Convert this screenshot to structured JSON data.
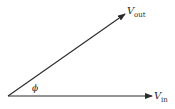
{
  "diagram": {
    "type": "phasor",
    "colors": {
      "stroke": "#2a2a2a",
      "background": "#ffffff"
    },
    "origin": [
      8,
      96
    ],
    "vectors": [
      {
        "name": "V_in",
        "symbol": "V",
        "subscript": "in",
        "tip": [
          152,
          96
        ]
      },
      {
        "name": "V_out",
        "symbol": "V",
        "subscript": "out",
        "tip": [
          125,
          14
        ]
      }
    ],
    "angle": {
      "symbol": "ϕ",
      "between": [
        "V_in",
        "V_out"
      ]
    }
  },
  "labels": {
    "vout_main": "V",
    "vout_sub": "out",
    "vin_main": "V",
    "vin_sub": "in",
    "phi": "ϕ"
  }
}
